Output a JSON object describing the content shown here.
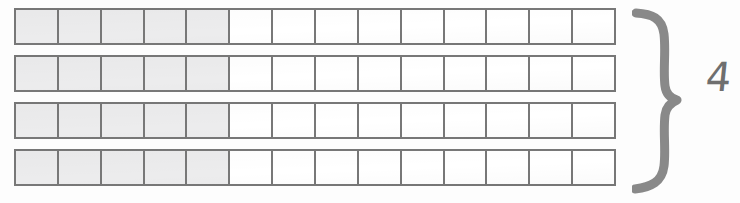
{
  "document": {
    "type": "hand-drawn math worksheet",
    "description": "Four identical bar models each divided into fourteen equal cells with the first five cells shaded, joined by a hand-drawn brace labelled 4"
  },
  "bar_model": {
    "row_count": 4,
    "cells_per_row": 14,
    "shaded_per_row": 5,
    "unshaded_per_row": 9,
    "colors": {
      "cell_border": "#787878",
      "cell_shaded_fill": "#ececed",
      "cell_empty_fill": "#ffffff",
      "page_background": "#fdfdfd",
      "ink": "#6f6f6f"
    },
    "rows": [
      {
        "label": "row-1",
        "cells": [
          "shaded",
          "shaded",
          "shaded",
          "shaded",
          "shaded",
          "empty",
          "empty",
          "empty",
          "empty",
          "empty",
          "empty",
          "empty",
          "empty",
          "empty"
        ]
      },
      {
        "label": "row-2",
        "cells": [
          "shaded",
          "shaded",
          "shaded",
          "shaded",
          "shaded",
          "empty",
          "empty",
          "empty",
          "empty",
          "empty",
          "empty",
          "empty",
          "empty",
          "empty"
        ]
      },
      {
        "label": "row-3",
        "cells": [
          "shaded",
          "shaded",
          "shaded",
          "shaded",
          "shaded",
          "empty",
          "empty",
          "empty",
          "empty",
          "empty",
          "empty",
          "empty",
          "empty",
          "empty"
        ]
      },
      {
        "label": "row-4",
        "cells": [
          "shaded",
          "shaded",
          "shaded",
          "shaded",
          "shaded",
          "empty",
          "empty",
          "empty",
          "empty",
          "empty",
          "empty",
          "empty",
          "empty",
          "empty"
        ]
      }
    ]
  },
  "annotation": {
    "brace_icon": "right-curly-brace-icon",
    "brace_direction": "closing",
    "group_count": "4"
  }
}
